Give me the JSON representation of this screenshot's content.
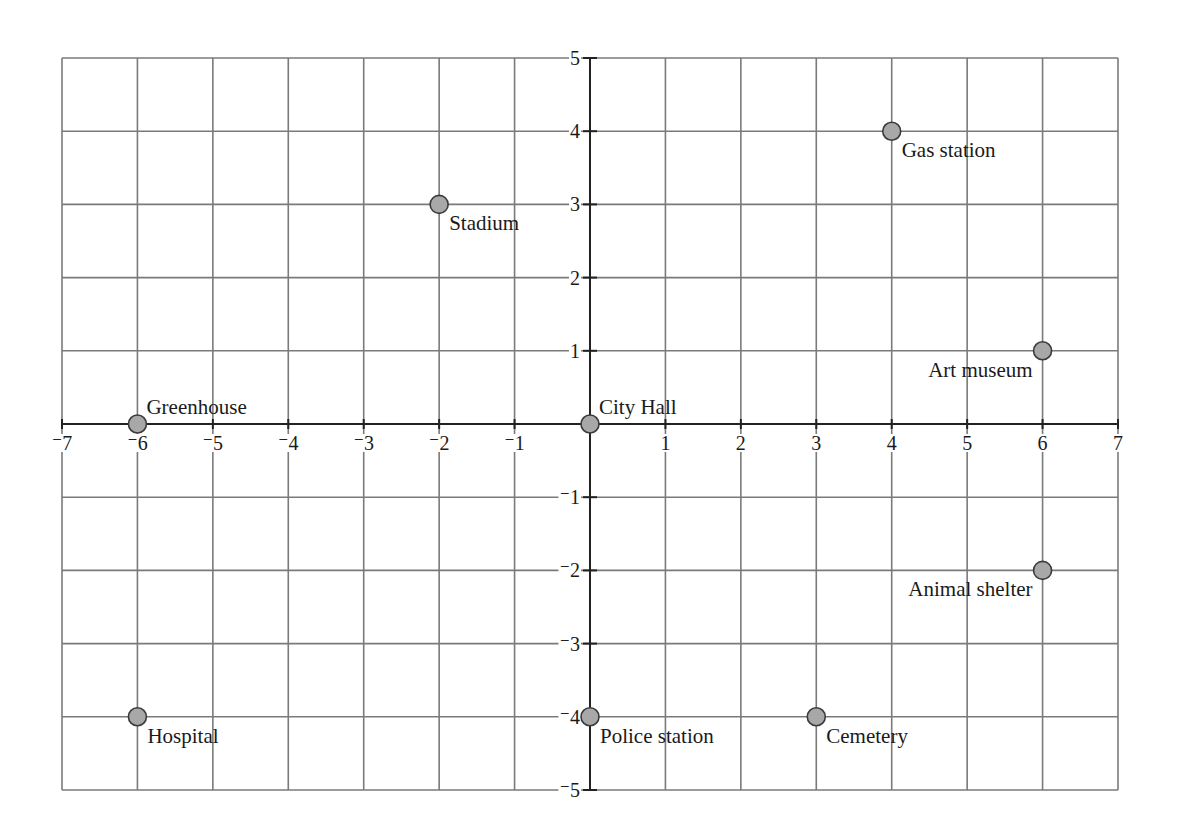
{
  "chart_data": {
    "type": "scatter",
    "title": "",
    "xlabel": "",
    "ylabel": "",
    "xlim": [
      -7,
      7
    ],
    "ylim": [
      -5,
      5
    ],
    "grid": true,
    "legend": null,
    "x_ticks": [
      -7,
      -6,
      -5,
      -4,
      -3,
      -2,
      -1,
      1,
      2,
      3,
      4,
      5,
      6,
      7
    ],
    "x_tick_labels": [
      "⁻7",
      "⁻6",
      "⁻5",
      "⁻4",
      "⁻3",
      "⁻2",
      "⁻1",
      "1",
      "2",
      "3",
      "4",
      "5",
      "6",
      "7"
    ],
    "y_ticks": [
      5,
      4,
      3,
      2,
      1,
      -1,
      -2,
      -3,
      -4,
      -5
    ],
    "y_tick_labels": [
      "5",
      "4",
      "3",
      "2",
      "1",
      "⁻1",
      "⁻2",
      "⁻3",
      "⁻4",
      "⁻5"
    ],
    "points": [
      {
        "label": "Gas station",
        "x": 4,
        "y": 4,
        "label_pos": "below-right"
      },
      {
        "label": "Stadium",
        "x": -2,
        "y": 3,
        "label_pos": "below-right"
      },
      {
        "label": "Art museum",
        "x": 6,
        "y": 1,
        "label_pos": "below-left"
      },
      {
        "label": "Greenhouse",
        "x": -6,
        "y": 0,
        "label_pos": "above-right"
      },
      {
        "label": "City Hall",
        "x": 0,
        "y": 0,
        "label_pos": "above-right"
      },
      {
        "label": "Animal shelter",
        "x": 6,
        "y": -2,
        "label_pos": "below-left"
      },
      {
        "label": "Hospital",
        "x": -6,
        "y": -4,
        "label_pos": "below-right"
      },
      {
        "label": "Police station",
        "x": 0,
        "y": -4,
        "label_pos": "below-right"
      },
      {
        "label": "Cemetery",
        "x": 3,
        "y": -4,
        "label_pos": "below-right"
      }
    ],
    "colors": {
      "grid": "#7a7a7a",
      "axis": "#222222",
      "point_fill": "#a8a8a8",
      "point_stroke": "#3a3a3a"
    }
  }
}
